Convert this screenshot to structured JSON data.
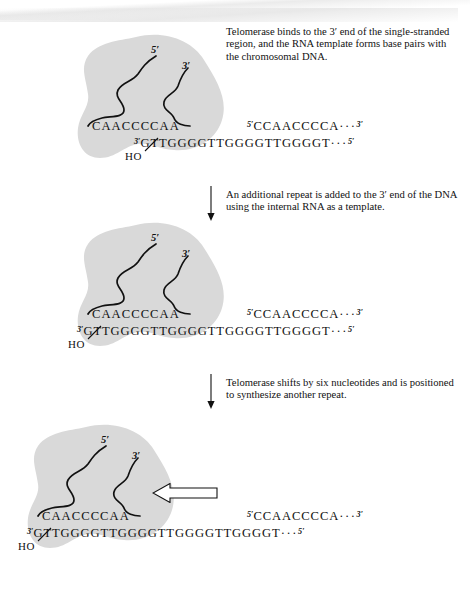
{
  "figure": {
    "blob_color": "#d9d9d9",
    "ink_color": "#111111"
  },
  "labels": {
    "five_prime": "5′",
    "three_prime": "3′",
    "ho": "HO"
  },
  "panels": [
    {
      "id": "panel-1",
      "caption": "Telomerase binds to the 3′ end of the single-stranded region, and the RNA template forms base pairs with the chromosomal DNA.",
      "rna_template": "CAACCCCAA",
      "top_strand_prime": "5′",
      "top_strand": "CCAACCCCA",
      "top_strand_dots": "···",
      "top_strand_end": "3′",
      "bottom_strand_prime": "3′",
      "bottom_strand": "GTTGGGGTTGGGGTTGGGGT",
      "bottom_strand_dots": "···",
      "bottom_strand_end": "5′"
    },
    {
      "id": "panel-2",
      "caption": "An additional repeat is added to the 3′ end of the DNA using the internal RNA as a template.",
      "rna_template": "CAACCCCAA",
      "top_strand_prime": "5′",
      "top_strand": "CCAACCCCA",
      "top_strand_dots": "···",
      "top_strand_end": "3′",
      "bottom_strand_prime": "3′",
      "bottom_strand": "GTTGGGGTTGGGGTTGGGGTTGGGGT",
      "bottom_strand_dots": "···",
      "bottom_strand_end": "5′"
    },
    {
      "id": "panel-3",
      "caption": "Telomerase shifts by six nucleotides and is positioned to synthesize another repeat.",
      "rna_template": "CAACCCCAA",
      "top_strand_prime": "5′",
      "top_strand": "CCAACCCCA",
      "top_strand_dots": "···",
      "top_strand_end": "3′",
      "bottom_strand_prime": "3′",
      "bottom_strand": "GTTGGGGTTGGGGTTGGGGTTGGGGT",
      "bottom_strand_dots": "···",
      "bottom_strand_end": "5′"
    }
  ],
  "arrows": {
    "step1_to_2": "downward-arrow",
    "step2_to_3": "downward-arrow",
    "shift": "leftward-hollow-arrow"
  }
}
